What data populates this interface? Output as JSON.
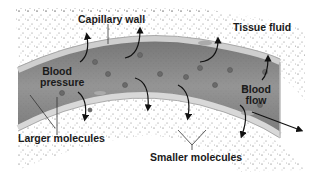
{
  "diagram": {
    "labels": {
      "capillary_wall": "Capillary wall",
      "tissue_fluid": "Tissue fluid",
      "blood_pressure_line1": "Blood",
      "blood_pressure_line2": "pressure",
      "blood_flow_line1": "Blood",
      "blood_flow_line2": "flow",
      "larger_molecules": "Larger molecules",
      "smaller_molecules": "Smaller molecules"
    },
    "colors": {
      "vessel_fill": "#8a8a8a",
      "vessel_dark": "#6e6e6e",
      "wall": "#d4d4d4",
      "stipple": "#555555",
      "arrow": "#111111",
      "text": "#1a1a1a"
    }
  }
}
